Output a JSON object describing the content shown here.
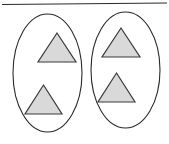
{
  "figure": {
    "name": "two-groups-of-triangles",
    "canvas": {
      "width": 169,
      "height": 144,
      "background_color": "#ffffff"
    },
    "divider": {
      "name": "top-horizontal-rule",
      "x1": 2,
      "y1": 4.5,
      "x2": 167,
      "y2": 3.0,
      "color": "#2b2b2b",
      "width": 1.2
    },
    "style": {
      "ellipse_stroke_color": "#2a2a2a",
      "ellipse_stroke_width": 1.1,
      "ellipse_fill": "none",
      "triangle_fill_color": "#d9d9d9",
      "triangle_stroke_color": "#3a3a3a",
      "triangle_stroke_width": 1.2
    },
    "groups": [
      {
        "label": "left-group",
        "ellipse": {
          "cx": 47.5,
          "cy": 73.0,
          "rx": 34.5,
          "ry": 59.0
        },
        "count": 2,
        "triangles": [
          {
            "label": "left-group-upper-triangle",
            "apex_x": 57.0,
            "apex_y": 33.0,
            "left_x": 38.0,
            "left_y": 62.0,
            "right_x": 76.0,
            "right_y": 62.0
          },
          {
            "label": "left-group-lower-triangle",
            "apex_x": 43.5,
            "apex_y": 85.0,
            "left_x": 25.0,
            "left_y": 114.0,
            "right_x": 62.0,
            "right_y": 114.0
          }
        ]
      },
      {
        "label": "right-group",
        "ellipse": {
          "cx": 125.5,
          "cy": 70.0,
          "rx": 34.5,
          "ry": 58.0
        },
        "count": 2,
        "triangles": [
          {
            "label": "right-group-upper-triangle",
            "apex_x": 121.0,
            "apex_y": 28.0,
            "left_x": 102.0,
            "left_y": 57.0,
            "right_x": 140.0,
            "right_y": 57.0
          },
          {
            "label": "right-group-lower-triangle",
            "apex_x": 116.5,
            "apex_y": 73.0,
            "left_x": 98.0,
            "left_y": 102.0,
            "right_x": 135.0,
            "right_y": 102.0
          }
        ]
      }
    ]
  }
}
